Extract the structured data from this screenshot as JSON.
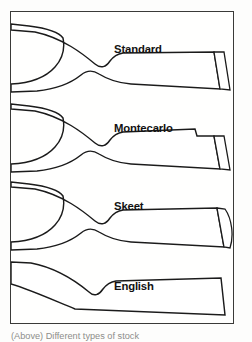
{
  "figure": {
    "caption": "(Above) Different types of stock",
    "frame": {
      "border_color": "#3a3a38",
      "background": "#ffffff"
    },
    "line_color": "#1b1b1b",
    "buttplate_fill": "#b9b9b7",
    "stocks": [
      {
        "label": "Standard",
        "label_x": 103,
        "label_y": 41,
        "has_buttplate": true,
        "buttplate_style": "hatched-straight",
        "grip_style": "pistol-grip",
        "comb_style": "straight-comb",
        "outline": "M 0 18 L 24 20 C 52 26 72 42 84 52 C 90 57 95 55 99 49 C 102 45 106 42 112 41 L 203 40 L 209 77 L 120 72 C 106 71 96 67 88 62 C 82 58 76 58 70 63 C 60 71 46 77 26 79 L 0 80 L 0 72 C 22 71 36 64 44 55 C 52 46 54 36 52 26 C 48 20 34 16 18 14 L 0 12 Z",
        "buttplate_path": "M 203 40 L 213 40 L 219 78 L 209 77 Z"
      },
      {
        "label": "Montecarlo",
        "label_x": 103,
        "label_y": 120,
        "has_buttplate": true,
        "buttplate_style": "hatched-straight",
        "grip_style": "pistol-grip",
        "comb_style": "montecarlo-raised-comb-with-step",
        "outline": "M 0 97 L 24 99 C 52 105 72 121 84 131 C 90 136 95 134 99 128 C 102 124 106 121 112 120 L 184 117 L 186 124 L 203 124 L 209 157 L 120 152 C 106 151 96 147 88 142 C 82 138 76 138 70 143 C 60 151 46 157 26 159 L 0 160 L 0 152 C 22 151 36 144 44 135 C 52 126 54 116 52 106 C 48 100 34 96 18 94 L 0 92 Z",
        "buttplate_path": "M 203 124 L 213 124 L 219 158 L 209 157 Z"
      },
      {
        "label": "Skeet",
        "label_x": 103,
        "label_y": 198,
        "has_buttplate": true,
        "buttplate_style": "hatched-curved",
        "grip_style": "pistol-grip",
        "comb_style": "straight-comb",
        "outline": "M 0 175 L 24 177 C 52 183 72 199 84 209 C 90 214 95 212 99 206 C 102 202 106 199 112 198 L 206 196 L 213 235 L 120 230 C 106 229 96 225 88 220 C 82 216 76 216 70 221 C 60 229 46 235 26 237 L 0 238 L 0 230 C 22 229 36 222 44 213 C 52 204 54 194 52 184 C 48 178 34 174 18 172 L 0 170 Z",
        "buttplate_path": "M 206 196 L 214 197 C 221 207 223 224 219 236 L 213 235 Z"
      },
      {
        "label": "English",
        "label_x": 103,
        "label_y": 278,
        "has_buttplate": false,
        "buttplate_style": "none",
        "grip_style": "straight-hand",
        "comb_style": "straight-comb",
        "outline": "M 0 250 L 20 251 C 46 256 66 270 78 280 C 83 285 88 283 92 277 C 95 273 99 270 105 269 L 210 266 L 214 303 L 64 297 C 42 288 20 278 0 272 Z",
        "buttplate_path": ""
      }
    ]
  }
}
